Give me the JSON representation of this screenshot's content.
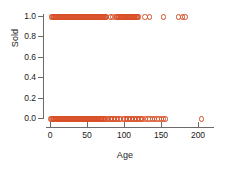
{
  "chart_data": {
    "type": "scatter",
    "title": "",
    "subtitle": "",
    "xlabel": "Age",
    "ylabel": "Sold",
    "xlim": [
      -8,
      215
    ],
    "ylim": [
      -0.06,
      1.06
    ],
    "xticks": [
      0,
      50,
      100,
      150,
      200
    ],
    "xtick_labels": [
      "0",
      "50",
      "100",
      "150",
      "200"
    ],
    "yticks": [
      0.0,
      0.2,
      0.4,
      0.6,
      0.8,
      1.0
    ],
    "ytick_labels": [
      "0.0",
      "0.2",
      "0.4",
      "0.6",
      "0.8",
      "1.0"
    ],
    "grid": false,
    "legend": null,
    "legend_position": "none",
    "marker": "open-circle",
    "marker_color": "#d94f27",
    "point_count": 214,
    "series": [
      {
        "name": "Sold = 1",
        "y_value": 1.0,
        "x": [
          1,
          2,
          3,
          4,
          5,
          6,
          7,
          8,
          9,
          10,
          11,
          12,
          13,
          14,
          15,
          16,
          17,
          18,
          19,
          20,
          21,
          22,
          23,
          24,
          25,
          26,
          27,
          28,
          29,
          30,
          31,
          32,
          33,
          34,
          35,
          36,
          37,
          38,
          39,
          40,
          41,
          42,
          43,
          44,
          45,
          46,
          47,
          48,
          49,
          50,
          51,
          52,
          53,
          54,
          55,
          56,
          57,
          58,
          59,
          60,
          61,
          62,
          63,
          64,
          65,
          66,
          67,
          68,
          69,
          70,
          71,
          72,
          73,
          74,
          75,
          80,
          83,
          88,
          89,
          90,
          91,
          92,
          93,
          94,
          95,
          96,
          97,
          98,
          99,
          100,
          101,
          102,
          103,
          104,
          105,
          106,
          107,
          108,
          109,
          110,
          111,
          112,
          113,
          114,
          115,
          116,
          117,
          118,
          127,
          133,
          152,
          172,
          178,
          181
        ]
      },
      {
        "name": "Sold = 0",
        "y_value": 0.0,
        "x": [
          0,
          1,
          2,
          3,
          4,
          5,
          6,
          7,
          8,
          9,
          10,
          11,
          12,
          13,
          14,
          15,
          16,
          17,
          18,
          19,
          20,
          21,
          22,
          23,
          24,
          25,
          26,
          27,
          28,
          29,
          30,
          31,
          32,
          33,
          34,
          35,
          36,
          37,
          38,
          39,
          40,
          41,
          42,
          43,
          44,
          45,
          46,
          47,
          48,
          49,
          50,
          51,
          52,
          53,
          54,
          55,
          56,
          57,
          58,
          59,
          60,
          61,
          62,
          63,
          64,
          65,
          66,
          67,
          68,
          69,
          70,
          72,
          74,
          76,
          78,
          80,
          82,
          84,
          86,
          88,
          90,
          92,
          94,
          98,
          100,
          102,
          104,
          106,
          108,
          110,
          112,
          114,
          116,
          118,
          120,
          122,
          124,
          128,
          131,
          134,
          137,
          140,
          143,
          146,
          149,
          152,
          155,
          203
        ]
      }
    ]
  }
}
